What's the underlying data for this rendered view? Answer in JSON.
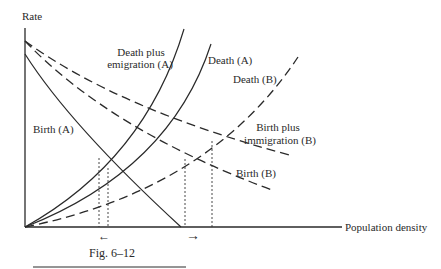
{
  "figure": {
    "caption": "Fig. 6–12",
    "y_axis_label": "Rate",
    "x_axis_label": "Population density"
  },
  "labels": {
    "death_plus_emigration_a_line1": "Death plus",
    "death_plus_emigration_a_line2": "emigration (A)",
    "death_a": "Death (A)",
    "death_b": "Death (B)",
    "birth_plus_immigration_b_line1": "Birth plus",
    "birth_plus_immigration_b_line2": "immigration (B)",
    "birth_b": "Birth (B)",
    "birth_a": "Birth (A)"
  },
  "arrows": {
    "left": "←",
    "right": "→"
  },
  "colors": {
    "ink": "#2a2a2a",
    "background": "#ffffff"
  }
}
